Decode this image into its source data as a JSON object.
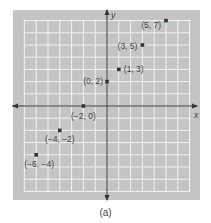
{
  "figure": {
    "caption": "(a)",
    "x_axis_label": "x",
    "y_axis_label": "y"
  },
  "chart_data": {
    "type": "scatter",
    "title": "",
    "xlabel": "x",
    "ylabel": "y",
    "xlim": [
      -7,
      7
    ],
    "ylim": [
      -7,
      7
    ],
    "grid": true,
    "points": [
      {
        "x": 5,
        "y": 7,
        "label": "(5, 7)"
      },
      {
        "x": 3,
        "y": 5,
        "label": "(3, 5)"
      },
      {
        "x": 1,
        "y": 3,
        "label": "(1, 3)"
      },
      {
        "x": 0,
        "y": 2,
        "label": "(0, 2)"
      },
      {
        "x": -2,
        "y": 0,
        "label": "(−2, 0)"
      },
      {
        "x": -4,
        "y": -2,
        "label": "(−4, −2)"
      },
      {
        "x": -6,
        "y": -4,
        "label": "(−6, −4)"
      }
    ]
  },
  "colors": {
    "panel": "#c4c4c4",
    "grid": "#f2f2f2",
    "axis": "#333333",
    "point": "#333333",
    "label": "#444444"
  }
}
